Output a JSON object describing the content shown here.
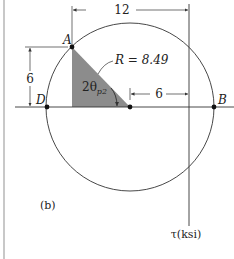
{
  "figure_label": "(b)",
  "axis": {
    "tau_label": "τ(ksi)"
  },
  "points": {
    "A": "A",
    "B": "B",
    "D": "D"
  },
  "radius_label": "R = 8.49",
  "angle_label": {
    "base": "2θ",
    "subscript": "p2"
  },
  "dimensions": {
    "top": "12",
    "horizontal": "6",
    "vertical": "6"
  },
  "colors": {
    "line": "#333333",
    "triangle_fill": "#8c8c8c",
    "left_border": "#c8c8c8"
  }
}
